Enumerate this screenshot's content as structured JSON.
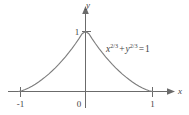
{
  "figure": {
    "name": "astroid-graph",
    "equation": {
      "full": "x^2/3 + y^2/3 = 1",
      "term1_base": "x",
      "term1_exp": "2/3",
      "plus": "+",
      "term2_base": "y",
      "term2_exp": "2/3",
      "equals": "=",
      "rhs": "1"
    },
    "axes": {
      "x_label": "x",
      "y_label": "y",
      "origin_label": "0",
      "x_ticks": [
        {
          "label": "-1",
          "value": -1
        },
        {
          "label": "1",
          "value": 1
        }
      ],
      "y_ticks": [
        {
          "label": "1",
          "value": 1
        }
      ]
    },
    "colors": {
      "curve": "#7d7d7d",
      "axis": "#6b6b6b",
      "text": "#3f3f3f",
      "background": "#ffffff"
    }
  },
  "chart_data": {
    "type": "line",
    "title": "",
    "subtitle": "",
    "xlabel": "x",
    "ylabel": "y",
    "xlim": [
      -1.25,
      1.35
    ],
    "ylim": [
      -0.2,
      1.3
    ],
    "grid": false,
    "legend": null,
    "annotations": [
      {
        "text": "x^2/3 + y^2/3 = 1",
        "x": 0.35,
        "y": 0.72
      }
    ],
    "xticks": [
      -1,
      0,
      1
    ],
    "xticklabels": [
      "-1",
      "0",
      "1"
    ],
    "yticks": [
      1
    ],
    "yticklabels": [
      "1"
    ],
    "series": [
      {
        "name": "x^(2/3) + y^(2/3) = 1 (upper half astroid)",
        "x": [
          -1.0,
          -0.95,
          -0.9,
          -0.85,
          -0.8,
          -0.75,
          -0.7,
          -0.65,
          -0.6,
          -0.55,
          -0.5,
          -0.45,
          -0.4,
          -0.35,
          -0.3,
          -0.25,
          -0.2,
          -0.15,
          -0.1,
          -0.05,
          0.0,
          0.05,
          0.1,
          0.15,
          0.2,
          0.25,
          0.3,
          0.35,
          0.4,
          0.45,
          0.5,
          0.55,
          0.6,
          0.65,
          0.7,
          0.75,
          0.8,
          0.85,
          0.9,
          0.95,
          1.0
        ],
        "y": [
          0.0,
          0.0112,
          0.0315,
          0.0572,
          0.0873,
          0.1211,
          0.1585,
          0.1993,
          0.2433,
          0.2906,
          0.3413,
          0.3953,
          0.4528,
          0.5138,
          0.5785,
          0.647,
          0.7195,
          0.7962,
          0.8774,
          0.9634,
          1.0,
          0.9634,
          0.8774,
          0.7962,
          0.7195,
          0.647,
          0.5785,
          0.5138,
          0.4528,
          0.3953,
          0.3413,
          0.2906,
          0.2433,
          0.1993,
          0.1585,
          0.1211,
          0.0873,
          0.0572,
          0.0315,
          0.0112,
          0.0
        ]
      }
    ]
  }
}
